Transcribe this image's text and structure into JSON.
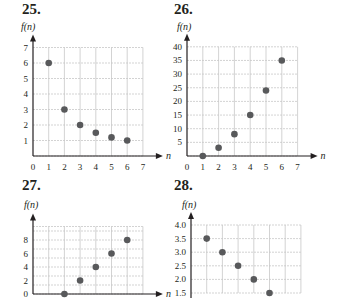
{
  "colors": {
    "point": "#58595b",
    "grid": "#c8c8c8",
    "axis": "#231f20",
    "text": "#231f20"
  },
  "chart_data": [
    {
      "id": "25",
      "label": "25.",
      "type": "scatter",
      "xlabel": "n",
      "ylabel": "f(n)",
      "x": [
        1,
        2,
        3,
        4,
        5,
        6
      ],
      "y": [
        6,
        3,
        2,
        1.5,
        1.2,
        1
      ],
      "xlim": [
        0,
        7
      ],
      "ylim": [
        0,
        7
      ],
      "xticks": [
        "0",
        "1",
        "2",
        "3",
        "4",
        "5",
        "6",
        "7"
      ],
      "yticks": [
        "1",
        "2",
        "3",
        "4",
        "5",
        "6",
        "7"
      ],
      "grid": true,
      "layout": {
        "ox": 33,
        "oy": 156,
        "sx": 15.7,
        "sy": 15.5,
        "xmax": 7,
        "ymax": 7,
        "ystep": 1,
        "ytickvals": [
          1,
          2,
          3,
          4,
          5,
          6,
          7
        ],
        "showX": true,
        "numx": 22,
        "numy": 2,
        "flx": 21,
        "fly": 22
      }
    },
    {
      "id": "26",
      "label": "26.",
      "type": "scatter",
      "xlabel": "n",
      "ylabel": "f(n)",
      "x": [
        1,
        2,
        3,
        4,
        5,
        6
      ],
      "y": [
        0,
        3,
        8,
        15,
        24,
        35
      ],
      "xlim": [
        0,
        7
      ],
      "ylim": [
        0,
        40
      ],
      "xticks": [
        "0",
        "1",
        "2",
        "3",
        "4",
        "5",
        "6",
        "7"
      ],
      "yticks": [
        "5",
        "10",
        "15",
        "20",
        "25",
        "30",
        "35",
        "40"
      ],
      "grid": true,
      "layout": {
        "ox": 187,
        "oy": 156,
        "sx": 15.8,
        "sy": 2.73,
        "xmax": 7,
        "ymax": 40,
        "ystep": 5,
        "ytickvals": [
          5,
          10,
          15,
          20,
          25,
          30,
          35,
          40
        ],
        "showX": true,
        "numx": 174,
        "numy": 2,
        "flx": 177,
        "fly": 22
      }
    },
    {
      "id": "27",
      "label": "27.",
      "type": "scatter",
      "xlabel": "n",
      "ylabel": "f(n)",
      "x": [
        2,
        3,
        4,
        5,
        6
      ],
      "y": [
        0,
        2,
        4,
        6,
        8
      ],
      "xlim": [
        0,
        7
      ],
      "ylim": [
        0,
        10
      ],
      "xticks": [],
      "yticks": [
        "0",
        "2",
        "4",
        "6",
        "8"
      ],
      "grid": true,
      "layout": {
        "ox": 33,
        "oy": 294,
        "sx": 15.7,
        "sy": 6.75,
        "xmax": 7,
        "ymax": 10,
        "ystep": 1.3333,
        "ytickvals": [
          0,
          2,
          4,
          6,
          8
        ],
        "showX": false,
        "numx": 22,
        "numy": 178,
        "flx": 24,
        "fly": 200
      }
    },
    {
      "id": "28",
      "label": "28.",
      "type": "scatter",
      "xlabel": "n",
      "ylabel": "f(n)",
      "x": [
        1,
        2,
        3,
        4,
        5
      ],
      "y": [
        3.5,
        3.0,
        2.5,
        2.0,
        1.5
      ],
      "xlim": [
        0,
        6
      ],
      "ylim": [
        1.5,
        4.0
      ],
      "xticks": [],
      "yticks": [
        "1.5",
        "2.0",
        "2.5",
        "3.0",
        "3.5",
        "4.0"
      ],
      "grid": true,
      "layout": {
        "ox": 191,
        "oy": 293,
        "sx": 15.7,
        "sy": 27.2,
        "xmax": 7,
        "ymax": 4.0,
        "ymin": 1.5,
        "ystep": 0.5,
        "ytickvals": [
          1.5,
          2.0,
          2.5,
          3.0,
          3.5,
          4.0
        ],
        "showX": false,
        "numx": 174,
        "numy": 178,
        "flx": 182,
        "fly": 200
      }
    }
  ]
}
